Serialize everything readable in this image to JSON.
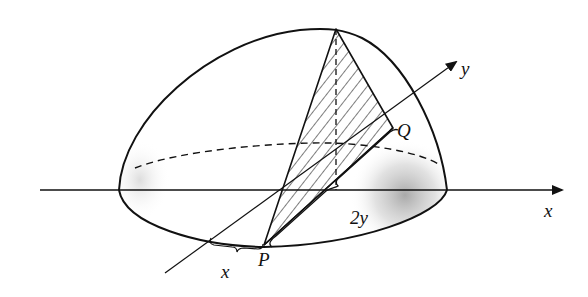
{
  "figure": {
    "labels": {
      "x_axis": "x",
      "y_axis": "y",
      "point_p": "P",
      "point_q": "Q",
      "distance_x": "x",
      "base_length": "2y"
    },
    "colors": {
      "stroke": "#111111",
      "background": "#ffffff",
      "shading": "#9a9a9a"
    }
  }
}
